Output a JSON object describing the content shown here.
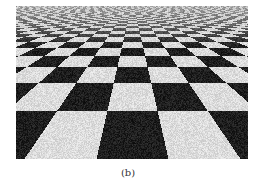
{
  "figure": {
    "caption": "(b)",
    "colors": {
      "dark_tile": "#1e1e1e",
      "light_tile": "#dcdcdc",
      "horizon_haze": "#c8c8c8",
      "caption_text": "#333333"
    }
  }
}
